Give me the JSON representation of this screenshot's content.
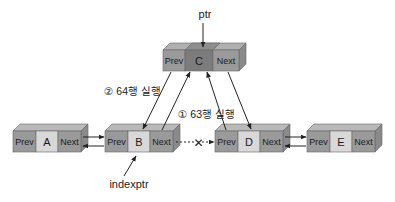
{
  "diagram": {
    "type": "doubly-linked-list-insertion",
    "pointers": {
      "ptr": "ptr",
      "indexptr": "indexptr"
    },
    "steps": {
      "step1": "① 63행 실행",
      "step2": "② 64행 실행"
    },
    "node_fields": {
      "prev": "Prev",
      "next": "Next"
    },
    "nodes": [
      {
        "id": "A",
        "value": "A"
      },
      {
        "id": "B",
        "value": "B"
      },
      {
        "id": "C",
        "value": "C"
      },
      {
        "id": "D",
        "value": "D"
      },
      {
        "id": "E",
        "value": "E"
      }
    ],
    "broken_link_marker": "✕",
    "colors": {
      "link_cell": "#9a9a9a",
      "link_cell_top": "#b9b9b9",
      "value_cell": "#d8d8d8",
      "value_cell_top": "#e8e8e8",
      "side": "#8a8a8a",
      "new_node_value": "#7c7c7c",
      "new_node_value_top": "#9a9a9a",
      "arrow": "#222222"
    }
  }
}
